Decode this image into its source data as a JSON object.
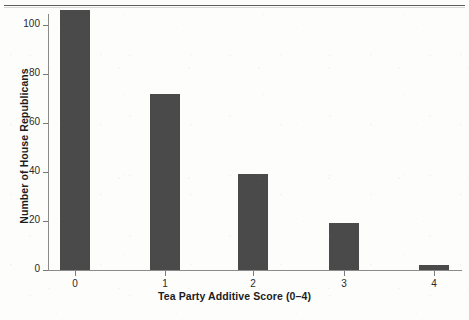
{
  "chart_data": {
    "type": "bar",
    "title": "",
    "xlabel": "Tea Party Additive Score (0–4)",
    "ylabel": "Number of House Republicans",
    "categories": [
      "0",
      "1",
      "2",
      "3",
      "4"
    ],
    "values": [
      106,
      72,
      39,
      19,
      2
    ],
    "series": [
      {
        "name": "Number of House Republicans",
        "values": [
          106,
          72,
          39,
          19,
          2
        ]
      }
    ],
    "ylim": [
      0,
      106
    ],
    "yticks": [
      0,
      20,
      40,
      60,
      80,
      100
    ],
    "ytick_labels": [
      "0",
      "20",
      "40",
      "60",
      "80",
      "100"
    ],
    "xtick_labels": [
      "0",
      "1",
      "2",
      "3",
      "4"
    ],
    "grid": false,
    "legend": false,
    "legend_position": "none",
    "bar_color": "#4a4a4a",
    "axis_color": "#8b8b8b",
    "text_color": "#1c1c1c",
    "background": "#fdfdfc"
  },
  "figure": {
    "top_rule": "horizontal-rule"
  }
}
